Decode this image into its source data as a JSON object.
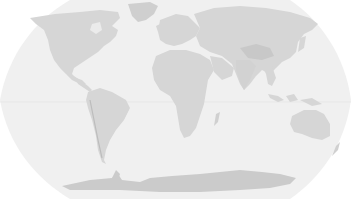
{
  "map": {
    "title": "World map",
    "projection": "Robinson",
    "colors": {
      "background": "#ffffff",
      "ocean": "#f0f0f0",
      "land": "#d6d6d6",
      "land_dark": "#c4c4c4",
      "antarctica": "#cbcbcb",
      "equator": "#e2e2e2"
    },
    "regions": [
      {
        "name": "North America"
      },
      {
        "name": "Greenland"
      },
      {
        "name": "South America"
      },
      {
        "name": "Europe"
      },
      {
        "name": "Africa"
      },
      {
        "name": "Madagascar"
      },
      {
        "name": "Asia"
      },
      {
        "name": "Arabian Peninsula"
      },
      {
        "name": "India"
      },
      {
        "name": "Southeast Asia"
      },
      {
        "name": "Japan"
      },
      {
        "name": "Indonesia"
      },
      {
        "name": "Australia"
      },
      {
        "name": "New Zealand"
      },
      {
        "name": "Antarctica"
      }
    ]
  }
}
